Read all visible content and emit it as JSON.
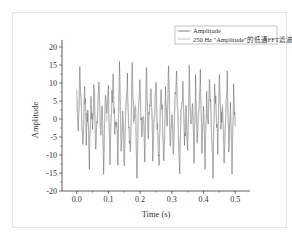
{
  "chart_data": {
    "type": "line",
    "title": "",
    "xlabel": "Time (s)",
    "ylabel": "Amplitude",
    "xlim": [
      -0.04,
      0.54
    ],
    "ylim": [
      -20,
      22
    ],
    "x_ticks": [
      "0.0",
      "0.1",
      "0.2",
      "0.3",
      "0.4",
      "0.5"
    ],
    "y_ticks": [
      "-20",
      "-15",
      "-10",
      "-5",
      "0",
      "5",
      "10",
      "15",
      "20"
    ],
    "grid": false,
    "legend_position": "top-right",
    "series": [
      {
        "name": "Amplitude",
        "color": "#4a4a4a",
        "description": "noisy oscillating signal, approx range -16 to 17",
        "x": [
          0.0,
          0.005,
          0.01,
          0.015,
          0.02,
          0.025,
          0.03,
          0.035,
          0.04,
          0.045,
          0.05,
          0.055,
          0.06,
          0.065,
          0.07,
          0.075,
          0.08,
          0.085,
          0.09,
          0.095,
          0.1,
          0.105,
          0.11,
          0.115,
          0.12,
          0.125,
          0.13,
          0.135,
          0.14,
          0.145,
          0.15,
          0.155,
          0.16,
          0.165,
          0.17,
          0.175,
          0.18,
          0.185,
          0.19,
          0.195,
          0.2,
          0.205,
          0.21,
          0.215,
          0.22,
          0.225,
          0.23,
          0.235,
          0.24,
          0.245,
          0.25,
          0.255,
          0.26,
          0.265,
          0.27,
          0.275,
          0.28,
          0.285,
          0.29,
          0.295,
          0.3,
          0.305,
          0.31,
          0.315,
          0.32,
          0.325,
          0.33,
          0.335,
          0.34,
          0.345,
          0.35,
          0.355,
          0.36,
          0.365,
          0.37,
          0.375,
          0.38,
          0.385,
          0.39,
          0.395,
          0.4,
          0.405,
          0.41,
          0.415,
          0.42,
          0.425,
          0.43,
          0.435,
          0.44,
          0.445,
          0.45,
          0.455,
          0.46,
          0.465,
          0.47,
          0.475,
          0.48,
          0.485,
          0.49,
          0.495,
          0.5
        ],
        "values": [
          8,
          -3,
          14,
          2,
          -8,
          11,
          -5,
          3,
          -12,
          6,
          -2,
          10,
          -9,
          1,
          13,
          -6,
          4,
          -14,
          7,
          -1,
          9,
          -11,
          3,
          12,
          -4,
          0,
          -10,
          15,
          -7,
          2,
          -13,
          5,
          11,
          -3,
          -8,
          16,
          -2,
          6,
          -15,
          4,
          10,
          -6,
          1,
          -12,
          14,
          -5,
          3,
          8,
          -9,
          0,
          12,
          -4,
          -11,
          7,
          2,
          -14,
          9,
          -1,
          15,
          -7,
          3,
          -10,
          6,
          11,
          -3,
          -13,
          4,
          8,
          -6,
          1,
          -9,
          13,
          -2,
          5,
          -12,
          10,
          -4,
          0,
          14,
          -8,
          3,
          -11,
          7,
          -1,
          12,
          -5,
          -14,
          9,
          2,
          -7,
          15,
          -3,
          6,
          -10,
          1,
          11,
          -9,
          4,
          -13,
          8,
          -2
        ],
        "approx_peak_max": 17,
        "approx_peak_min": -16
      },
      {
        "name": "250 Hz \"Amplitude\"的低通FFT滤波",
        "color": "#b0b0b0",
        "description": "low-pass filtered signal, lighter gray, overlapping the raw signal with smaller amplitude"
      }
    ]
  },
  "legend": {
    "items": [
      {
        "label": "Amplitude",
        "color": "#4a4a4a"
      },
      {
        "label": "250 Hz \"Amplitude\"的低通FFT滤波",
        "color": "#b0b0b0"
      }
    ]
  },
  "axes": {
    "x": {
      "title": "Time (s)",
      "ticks": [
        {
          "v": 0.0,
          "label": "0.0"
        },
        {
          "v": 0.1,
          "label": "0.1"
        },
        {
          "v": 0.2,
          "label": "0.2"
        },
        {
          "v": 0.3,
          "label": "0.3"
        },
        {
          "v": 0.4,
          "label": "0.4"
        },
        {
          "v": 0.5,
          "label": "0.5"
        }
      ]
    },
    "y": {
      "title": "Amplitude",
      "ticks": [
        {
          "v": 20,
          "label": "20"
        },
        {
          "v": 15,
          "label": "15"
        },
        {
          "v": 10,
          "label": "10"
        },
        {
          "v": 5,
          "label": "5"
        },
        {
          "v": 0,
          "label": "0"
        },
        {
          "v": -5,
          "label": "-5"
        },
        {
          "v": -10,
          "label": "-10"
        },
        {
          "v": -15,
          "label": "-15"
        },
        {
          "v": -20,
          "label": "-20"
        }
      ]
    }
  }
}
